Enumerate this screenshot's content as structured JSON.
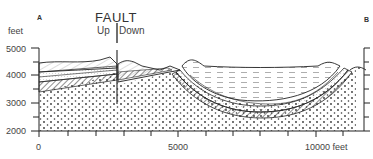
{
  "labels": {
    "left_end": "A",
    "right_end": "B"
  },
  "fault": {
    "title": "FAULT",
    "up": "Up",
    "down": "Down"
  },
  "y_axis": {
    "unit": "feet",
    "ticks": [
      "5000",
      "4000",
      "3000",
      "2000"
    ]
  },
  "x_axis": {
    "ticks": [
      "0",
      "5000",
      "10000 feet"
    ]
  },
  "colors": {
    "line": "#222222",
    "text": "#444444",
    "background": "#ffffff"
  }
}
